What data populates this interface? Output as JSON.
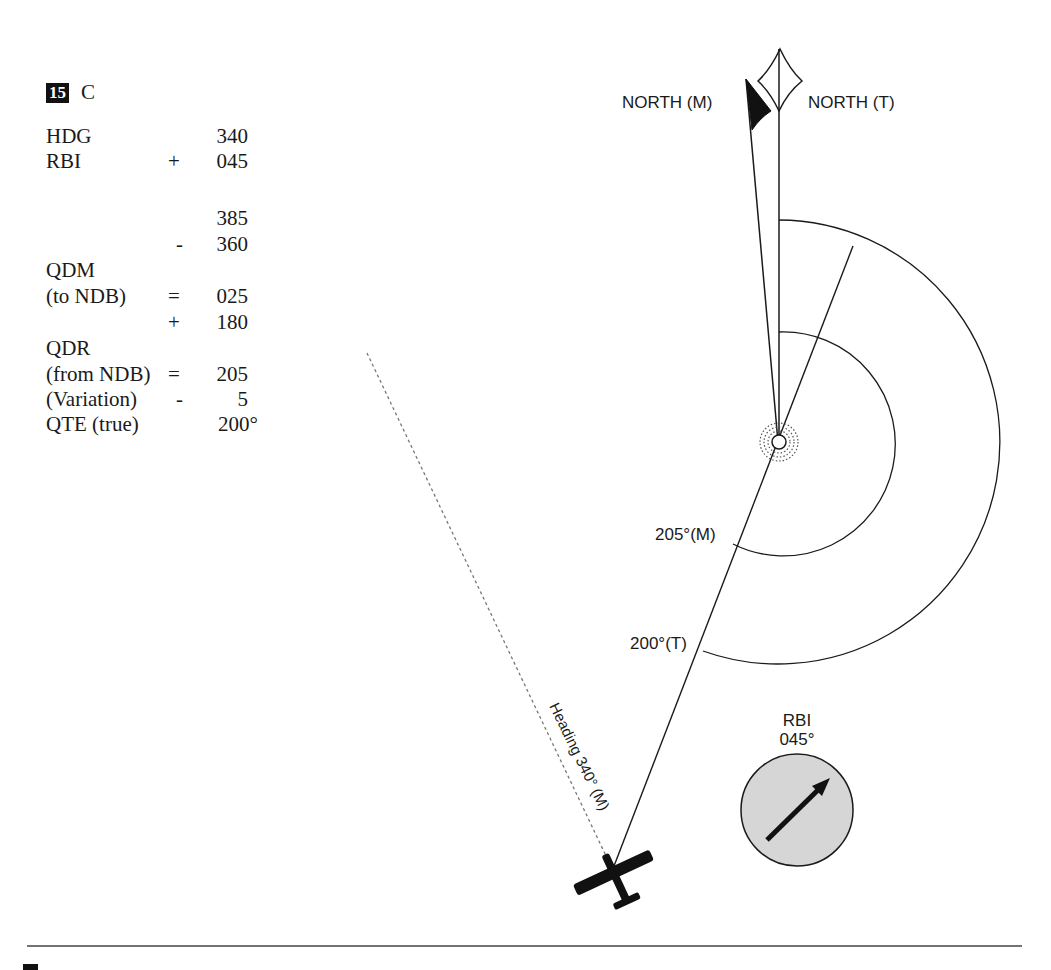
{
  "question": {
    "number": "15",
    "answer": "C"
  },
  "calculation": [
    {
      "label": "HDG",
      "op": "",
      "value": "340"
    },
    {
      "label": "RBI",
      "op": "+",
      "value": "045"
    },
    {
      "label": "",
      "op": "",
      "value": "385"
    },
    {
      "label": "",
      "op": "-",
      "value": "360"
    },
    {
      "label": "QDM",
      "op": "",
      "value": ""
    },
    {
      "label": "(to NDB)",
      "op": "=",
      "value": "025"
    },
    {
      "label": "",
      "op": "+",
      "value": "180"
    },
    {
      "label": "QDR",
      "op": "",
      "value": ""
    },
    {
      "label": "(from NDB)",
      "op": "=",
      "value": "205"
    },
    {
      "label": "(Variation)",
      "op": "-",
      "value": "5"
    },
    {
      "label": "QTE (true)",
      "op": "",
      "value": "200°"
    }
  ],
  "diagram": {
    "north_magnetic_label": "NORTH (M)",
    "north_true_label": "NORTH (T)",
    "bearing_magnetic_label": "205°(M)",
    "bearing_true_label": "200°(T)",
    "heading_label": "Heading 340° (M)",
    "rbi_title": "RBI",
    "rbi_value": "045°",
    "colors": {
      "ink": "#1a1a1a",
      "rbi_fill": "#d6d6d6",
      "dashed": "#777777"
    }
  }
}
